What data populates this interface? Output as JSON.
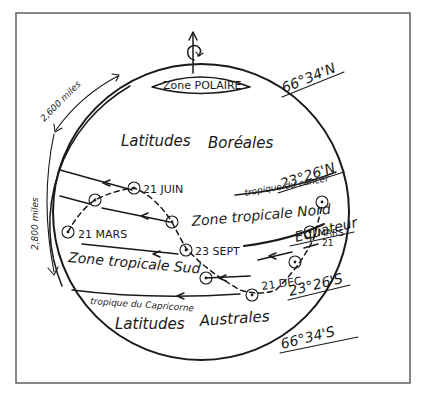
{
  "diagram": {
    "colors": {
      "ink": "#1a1a1a",
      "paper": "#ffffff",
      "frame": "#555555"
    },
    "rotation_icon": "rotation-arrow-icon",
    "zones": {
      "polar": "Zone POLAIRE",
      "north_lat": "Latitudes",
      "north_lat_2": "Boréales",
      "trop_north": "Zone tropicale Nord",
      "trop_south": "Zone tropicale Sud",
      "south_lat": "Latitudes",
      "south_lat_2": "Australes"
    },
    "lines": {
      "cancer": "tropique du cancer",
      "capricorn": "tropique du Capricorne",
      "equator": "Equateur"
    },
    "latitudes": {
      "arctic": "66°34'N",
      "cancer": "23°26'N",
      "capricorn": "23°26'S",
      "antarctic": "66°34'S"
    },
    "dates": {
      "june": "21 JUIN",
      "march_left": "21 MARS",
      "sept": "23 SEPT",
      "march_right_1": "MARS",
      "march_right_2": "21",
      "dec": "21 DEC"
    },
    "distances": {
      "upper": "2,600 miles",
      "lower": "2,800 miles"
    }
  }
}
